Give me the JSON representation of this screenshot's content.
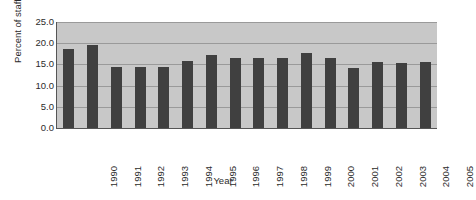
{
  "chart_data": {
    "type": "bar",
    "title": "",
    "subtitle": "",
    "xlabel": "Year",
    "ylabel": "Percent of staff",
    "categories": [
      "1990",
      "1991",
      "1992",
      "1993",
      "1994",
      "1995",
      "1996",
      "1997",
      "1998",
      "1999",
      "2000",
      "2001",
      "2002",
      "2003",
      "2004",
      "2005"
    ],
    "values": [
      18.7,
      19.6,
      14.3,
      14.3,
      14.3,
      15.9,
      17.3,
      16.4,
      16.4,
      16.5,
      17.7,
      16.4,
      14.2,
      15.6,
      15.4,
      15.6
    ],
    "ylim": [
      0.0,
      25.0
    ],
    "ytick_labels": [
      "25.0",
      "20.0",
      "15.0",
      "10.0",
      "5.0",
      "0.0"
    ],
    "ytick_values": [
      25.0,
      20.0,
      15.0,
      10.0,
      5.0,
      0.0
    ],
    "grid": true,
    "legend": false,
    "legend_position": "none",
    "colors": {
      "bar": "#404040",
      "plot_background": "#c8c8c8",
      "gridline": "#9a9a9a",
      "axis": "#555555",
      "text": "#2b2b2b",
      "page_background": "#ffffff"
    }
  }
}
